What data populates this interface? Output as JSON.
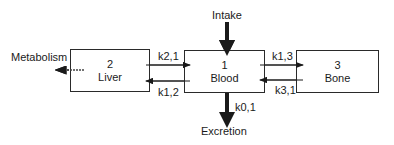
{
  "diagram": {
    "compartments": [
      {
        "id": "2",
        "name": "Liver"
      },
      {
        "id": "1",
        "name": "Blood"
      },
      {
        "id": "3",
        "name": "Bone"
      }
    ],
    "flows": {
      "intake": "Intake",
      "excretion": "Excretion",
      "metabolism": "Metabolism",
      "k21": "k2,1",
      "k12": "k1,2",
      "k13": "k1,3",
      "k31": "k3,1",
      "k01": "k0,1"
    }
  }
}
